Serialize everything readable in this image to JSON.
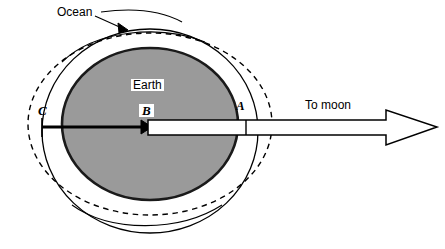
{
  "figure": {
    "background_color": "#ffffff",
    "labels": {
      "ocean": "Ocean",
      "earth": "Earth",
      "to_moon": "To moon",
      "point_a": "A",
      "point_b": "B",
      "point_c": "C"
    },
    "colors": {
      "earth_fill": "#9a9a9a",
      "earth_stroke": "#000000",
      "ocean_stroke": "#000000",
      "bulge_stroke": "#000000",
      "arrow_stroke": "#000000",
      "arrow_fill": "#ffffff",
      "label_text": "#000000"
    },
    "geometry": {
      "earth_center_x": 150,
      "earth_center_y": 124,
      "earth_radius_x": 88,
      "earth_radius_y": 76,
      "ocean_radius_x": 108,
      "ocean_radius_y": 102,
      "bulge_radius_x": 122,
      "bulge_radius_y": 91,
      "arrow_tip_x": 437,
      "arrow_axis_y": 127,
      "shaft_left_x": 42,
      "shaft_top_y": 120,
      "shaft_bottom_y": 135
    },
    "elements": {
      "earth_body": "filled gray ellipse representing solid Earth",
      "ocean_circle": "solid black circle representing undisturbed ocean surface",
      "tidal_bulge": "dashed ellipse elongated toward the moon representing tidal bulge",
      "axis_line": "horizontal line through points C, B and A toward the moon",
      "moon_arrow": "hollow outlined arrow pointing right toward the moon",
      "ocean_leader": "curved leader line with arrowhead from the Ocean label to the dashed bulge"
    }
  }
}
